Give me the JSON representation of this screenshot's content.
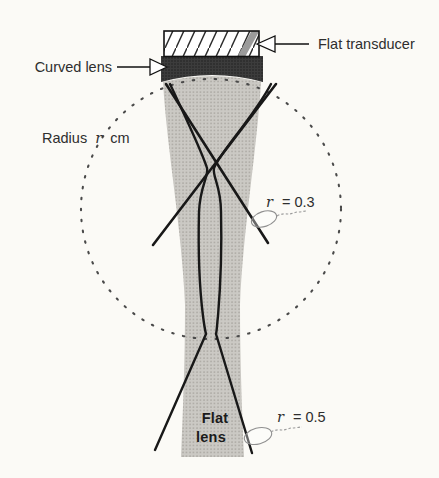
{
  "figure": {
    "labels": {
      "flat_transducer": "Flat transducer",
      "curved_lens": "Curved lens",
      "radius_prefix": "Radius",
      "radius_var": "r",
      "radius_unit": "cm",
      "r03_var": "r",
      "r03_value": "= 0.3",
      "r05_var": "r",
      "r05_value": "= 0.5",
      "flat_lens_line1": "Flat",
      "flat_lens_line2": "lens"
    },
    "colors": {
      "background": "#fbfaf6",
      "beam_fill": "#cbc9c4",
      "beam_dot": "#a5a29c",
      "lens_fill": "#383838",
      "lens_dot": "#1f1f1f",
      "ink": "#1b1b1b",
      "hatch_ink": "#2a2a2a",
      "transducer_band": "#9b9b9b",
      "dotted_circle": "#4a4a4a",
      "label_ink": "#2e2e2e",
      "callout_stroke": "#8f8f8f"
    }
  }
}
